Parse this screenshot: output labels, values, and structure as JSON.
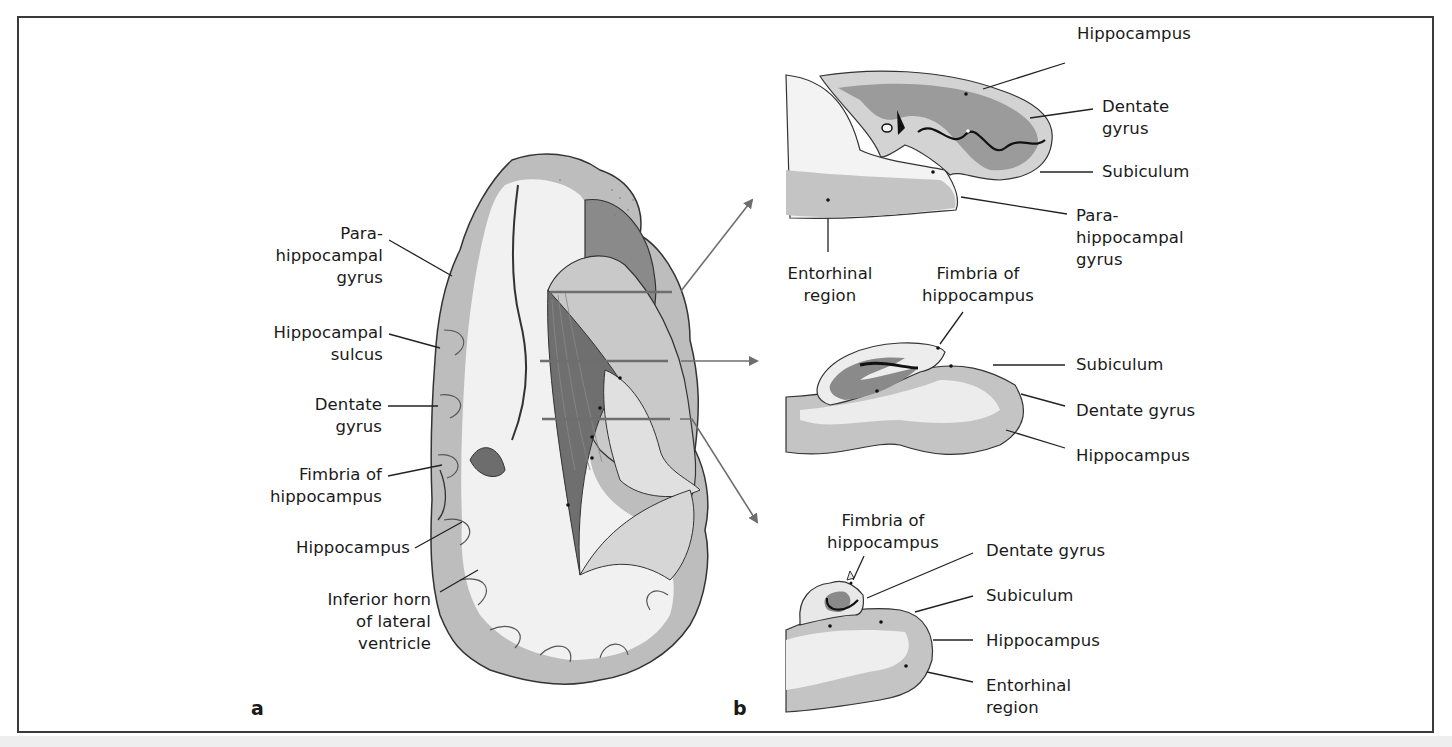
{
  "figure": {
    "panels": {
      "a": {
        "letter": "a"
      },
      "b": {
        "letter": "b"
      }
    },
    "panel_a_labels": [
      {
        "id": "parahippocampal-gyrus",
        "text": "Para-\nhippocampal\ngyrus"
      },
      {
        "id": "hippocampal-sulcus",
        "text": "Hippocampal\nsulcus"
      },
      {
        "id": "dentate-gyrus",
        "text": "Dentate\ngyrus"
      },
      {
        "id": "fimbria-of-hippocampus",
        "text": "Fimbria of\nhippocampus"
      },
      {
        "id": "hippocampus",
        "text": "Hippocampus"
      },
      {
        "id": "inferior-horn",
        "text": "Inferior horn\nof lateral\nventricle"
      }
    ],
    "section_top_labels": [
      {
        "id": "hippocampus",
        "text": "Hippocampus"
      },
      {
        "id": "dentate-gyrus",
        "text": "Dentate\ngyrus"
      },
      {
        "id": "subiculum",
        "text": "Subiculum"
      },
      {
        "id": "parahippocampal-gyrus",
        "text": "Para-\nhippocampal\ngyrus"
      },
      {
        "id": "entorhinal-region",
        "text": "Entorhinal\nregion"
      },
      {
        "id": "fimbria-of-hippocampus",
        "text": "Fimbria of\nhippocampus"
      }
    ],
    "section_middle_labels": [
      {
        "id": "subiculum",
        "text": "Subiculum"
      },
      {
        "id": "dentate-gyrus",
        "text": "Dentate gyrus"
      },
      {
        "id": "hippocampus",
        "text": "Hippocampus"
      }
    ],
    "section_bottom_labels": [
      {
        "id": "fimbria-of-hippocampus",
        "text": "Fimbria of\nhippocampus"
      },
      {
        "id": "dentate-gyrus",
        "text": "Dentate gyrus"
      },
      {
        "id": "subiculum",
        "text": "Subiculum"
      },
      {
        "id": "hippocampus",
        "text": "Hippocampus"
      },
      {
        "id": "entorhinal-region",
        "text": "Entorhinal\nregion"
      }
    ],
    "colors": {
      "frame": "#3a3a3a",
      "gray_matter": "#b9b9b9",
      "white_matter": "#efefef",
      "dark_tissue": "#7a7a7a",
      "arrow": "#6e6e6e"
    }
  }
}
